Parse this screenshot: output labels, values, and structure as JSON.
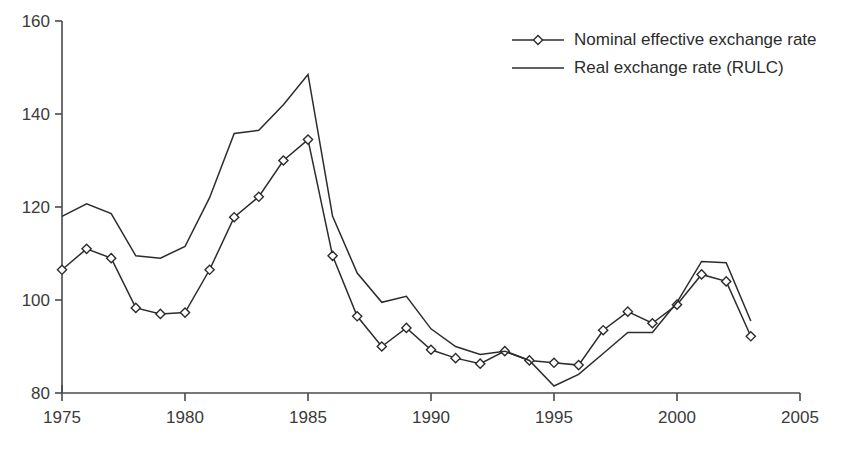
{
  "chart_data": {
    "type": "line",
    "title": "",
    "subtitle": "",
    "xlabel": "",
    "ylabel": "",
    "xlim": [
      1975,
      2005
    ],
    "ylim": [
      80,
      160
    ],
    "x_ticks": [
      1975,
      1980,
      1985,
      1990,
      1995,
      2000,
      2005
    ],
    "y_ticks": [
      80,
      100,
      120,
      140,
      160
    ],
    "grid": false,
    "legend_position": "top-right",
    "x": [
      1975,
      1976,
      1977,
      1978,
      1979,
      1980,
      1981,
      1982,
      1983,
      1984,
      1985,
      1986,
      1987,
      1988,
      1989,
      1990,
      1991,
      1992,
      1993,
      1994,
      1995,
      1996,
      1997,
      1998,
      1999,
      2000,
      2001,
      2002,
      2003
    ],
    "series": [
      {
        "name": "Nominal effective exchange rate",
        "marker": "diamond",
        "values": [
          106.5,
          111.0,
          109.0,
          98.3,
          97.0,
          97.3,
          106.5,
          117.8,
          122.2,
          130.0,
          134.5,
          109.5,
          96.5,
          90.0,
          94.0,
          89.3,
          87.5,
          86.3,
          89.0,
          87.0,
          86.5,
          86.0,
          93.5,
          97.5,
          95.0,
          99.0,
          105.5,
          104.0,
          92.2
        ]
      },
      {
        "name": "Real exchange rate (RULC)",
        "marker": "none",
        "values": [
          118.0,
          120.7,
          118.6,
          109.5,
          109.0,
          111.5,
          122.0,
          135.8,
          136.5,
          142.0,
          148.5,
          118.0,
          105.8,
          99.5,
          100.8,
          93.8,
          90.0,
          88.3,
          89.0,
          87.0,
          81.5,
          84.0,
          88.5,
          93.0,
          93.0,
          99.5,
          108.3,
          108.0,
          95.5
        ]
      }
    ],
    "legend": [
      {
        "label": "Nominal effective exchange rate",
        "marker": "diamond"
      },
      {
        "label": "Real exchange rate (RULC)",
        "marker": "none"
      }
    ],
    "colors": {
      "line": "#2c2c2c",
      "axis": "#4a4a4a",
      "marker_fill": "#ffffff",
      "background": "#ffffff"
    }
  }
}
